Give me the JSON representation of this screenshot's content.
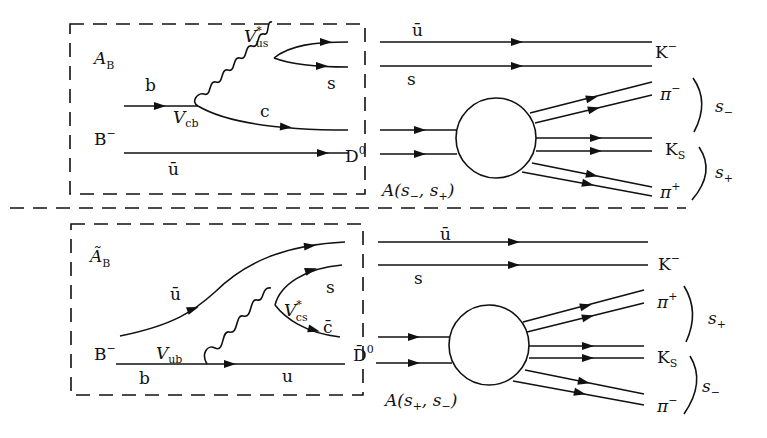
{
  "top": {
    "box_label": "A",
    "box_label_sub": "B",
    "b_quark": "b",
    "ckm_vertex": "V",
    "ckm_vertex_sub": "cb",
    "w_vertex": "V",
    "w_vertex_sup": "*",
    "w_vertex_sub": "us",
    "c_quark": "c",
    "s_quark_box": "s",
    "meson_in": "B",
    "meson_in_sup": "−",
    "ubar_spectator": "ū",
    "d_meson": "D",
    "d_meson_sup": "0",
    "ubar_out": "ū",
    "s_out": "s",
    "kaon": "K",
    "kaon_sup": "−",
    "pi_upper": "π",
    "pi_upper_sup": "−",
    "ks": "K",
    "ks_sub": "S",
    "pi_lower": "π",
    "pi_lower_sup": "+",
    "s_upper": "s",
    "s_upper_sub": "−",
    "s_lower": "s",
    "s_lower_sub": "+",
    "amplitude": "A(s",
    "amplitude_s1_sub": "−",
    "amplitude_mid": ", s",
    "amplitude_s2_sub": "+",
    "amplitude_close": ")"
  },
  "bottom": {
    "box_label": "Ã",
    "box_label_sub": "B",
    "ubar_quark": "ū",
    "ckm_vertex": "V",
    "ckm_vertex_sub": "ub",
    "w_vertex": "V",
    "w_vertex_sup": "*",
    "w_vertex_sub": "cs",
    "s_quark_box": "s",
    "cbar_quark": "c̄",
    "meson_in": "B",
    "meson_in_sup": "−",
    "b_quark": "b",
    "u_quark": "u",
    "d_meson": "D̄",
    "d_meson_sup": "0",
    "ubar_out": "ū",
    "s_out": "s",
    "kaon": "K",
    "kaon_sup": "−",
    "pi_upper": "π",
    "pi_upper_sup": "+",
    "ks": "K",
    "ks_sub": "S",
    "pi_lower": "π",
    "pi_lower_sup": "−",
    "s_upper": "s",
    "s_upper_sub": "+",
    "s_lower": "s",
    "s_lower_sub": "−",
    "amplitude": "A(s",
    "amplitude_s1_sub": "+",
    "amplitude_mid": ", s",
    "amplitude_s2_sub": "−",
    "amplitude_close": ")"
  }
}
